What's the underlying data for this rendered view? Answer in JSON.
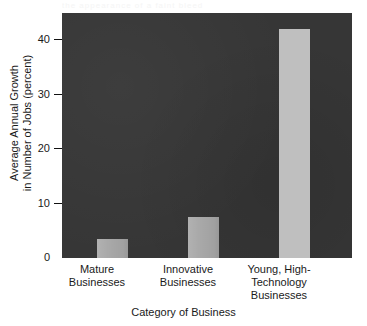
{
  "scan_artifact_text": "the appearance of a faint bleed",
  "chart_data": {
    "type": "bar",
    "title": "",
    "xlabel": "Category of Business",
    "ylabel": "Average Annual Growth in Number of Jobs (percent)",
    "ylabel_lines": [
      "Average Annual Growth",
      "in Number of Jobs (percent)"
    ],
    "categories": [
      "Mature Businesses",
      "Innovative Businesses",
      "Young, High-Technology Businesses"
    ],
    "category_lines": [
      [
        "Mature",
        "Businesses"
      ],
      [
        "Innovative",
        "Businesses"
      ],
      [
        "Young, High-",
        "Technology",
        "Businesses"
      ]
    ],
    "values": [
      3.5,
      7.5,
      42
    ],
    "ylim": [
      0,
      45
    ],
    "yticks": [
      0,
      10,
      20,
      30,
      40
    ],
    "ytick_labels": [
      "0",
      "10",
      "20",
      "30",
      "40"
    ],
    "grid": false,
    "legend": "none",
    "colors": {
      "plot_background": "#363636",
      "page_background": "#ffffff",
      "bar_small": "#a9a9a9",
      "bar_large": "#bfbfbf",
      "text": "#1a1a1a"
    }
  }
}
